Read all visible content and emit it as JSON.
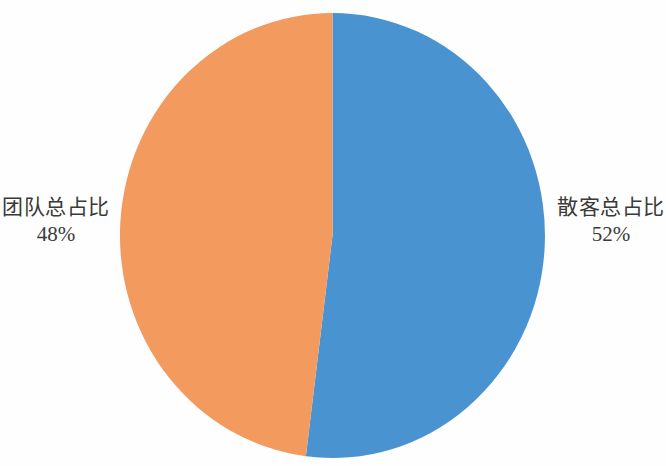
{
  "chart_data": {
    "type": "pie",
    "title": "",
    "subtitle": "",
    "xlabel": "",
    "ylabel": "",
    "legend_position": "none",
    "grid": false,
    "labels_outside": true,
    "start_angle_deg": 0,
    "direction": "clockwise",
    "categories": [
      "散客总占比",
      "团队总占比"
    ],
    "values": [
      52,
      48
    ],
    "value_labels": [
      "52%",
      "48%"
    ],
    "colors": [
      "#4a93d1",
      "#f39a5e"
    ],
    "slices": [
      {
        "name": "散客总占比",
        "value": 52,
        "value_label": "52%",
        "color": "#4a93d1",
        "label_side": "right"
      },
      {
        "name": "团队总占比",
        "value": 48,
        "value_label": "48%",
        "color": "#f39a5e",
        "label_side": "left"
      }
    ]
  },
  "figure": {
    "background_color": "#fefefe",
    "text_color": "#3a3a3a"
  }
}
